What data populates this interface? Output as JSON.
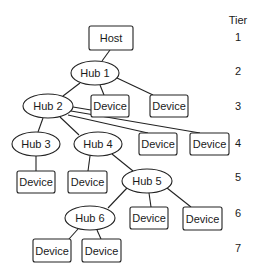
{
  "diagram": {
    "tier_header": "Tier",
    "tiers": [
      {
        "label": "1",
        "y": 41
      },
      {
        "label": "2",
        "y": 75
      },
      {
        "label": "3",
        "y": 110
      },
      {
        "label": "4",
        "y": 147
      },
      {
        "label": "5",
        "y": 181
      },
      {
        "label": "6",
        "y": 217
      },
      {
        "label": "7",
        "y": 252
      }
    ],
    "nodes": [
      {
        "id": "host",
        "type": "box",
        "label": "Host",
        "x": 89,
        "y": 26,
        "w": 44,
        "h": 24
      },
      {
        "id": "hub1",
        "type": "hub",
        "label": "Hub 1",
        "cx": 95,
        "cy": 73,
        "rx": 24,
        "ry": 12
      },
      {
        "id": "hub2",
        "type": "hub",
        "label": "Hub 2",
        "cx": 48,
        "cy": 106,
        "rx": 25,
        "ry": 12
      },
      {
        "id": "dev3a",
        "type": "box",
        "label": "Device",
        "x": 91,
        "y": 95,
        "w": 38,
        "h": 22
      },
      {
        "id": "dev3b",
        "type": "box",
        "label": "Device",
        "x": 150,
        "y": 95,
        "w": 38,
        "h": 22
      },
      {
        "id": "hub3",
        "type": "hub",
        "label": "Hub 3",
        "cx": 36,
        "cy": 144,
        "rx": 24,
        "ry": 12
      },
      {
        "id": "hub4",
        "type": "hub",
        "label": "Hub 4",
        "cx": 98,
        "cy": 144,
        "rx": 24,
        "ry": 12
      },
      {
        "id": "dev4a",
        "type": "box",
        "label": "Device",
        "x": 139,
        "y": 133,
        "w": 38,
        "h": 22
      },
      {
        "id": "dev4b",
        "type": "box",
        "label": "Device",
        "x": 190,
        "y": 133,
        "w": 39,
        "h": 22
      },
      {
        "id": "dev5a",
        "type": "box",
        "label": "Device",
        "x": 17,
        "y": 171,
        "w": 38,
        "h": 22
      },
      {
        "id": "dev5b",
        "type": "box",
        "label": "Device",
        "x": 68,
        "y": 171,
        "w": 39,
        "h": 22
      },
      {
        "id": "hub5",
        "type": "hub",
        "label": "Hub 5",
        "cx": 147,
        "cy": 181,
        "rx": 25,
        "ry": 12
      },
      {
        "id": "hub6",
        "type": "hub",
        "label": "Hub 6",
        "cx": 90,
        "cy": 218,
        "rx": 25,
        "ry": 12
      },
      {
        "id": "dev6a",
        "type": "box",
        "label": "Device",
        "x": 130,
        "y": 207,
        "w": 38,
        "h": 22
      },
      {
        "id": "dev6b",
        "type": "box",
        "label": "Device",
        "x": 183,
        "y": 207,
        "w": 39,
        "h": 23
      },
      {
        "id": "dev7a",
        "type": "box",
        "label": "Device",
        "x": 33,
        "y": 239,
        "w": 38,
        "h": 23
      },
      {
        "id": "dev7b",
        "type": "box",
        "label": "Device",
        "x": 82,
        "y": 239,
        "w": 39,
        "h": 23
      }
    ],
    "edges": [
      {
        "from": "host",
        "to": "hub1",
        "x1": 110,
        "y1": 50,
        "x2": 102,
        "y2": 61
      },
      {
        "from": "hub1",
        "to": "hub2",
        "x1": 80,
        "y1": 83,
        "x2": 63,
        "y2": 96
      },
      {
        "from": "hub1",
        "to": "dev3a",
        "x1": 100,
        "y1": 85,
        "x2": 104,
        "y2": 95
      },
      {
        "from": "hub1",
        "to": "dev3b",
        "x1": 117,
        "y1": 78,
        "x2": 153,
        "y2": 95
      },
      {
        "from": "hub2",
        "to": "dev3a",
        "x1": 73,
        "y1": 107,
        "x2": 91,
        "y2": 110
      },
      {
        "from": "hub2",
        "to": "dev4b",
        "x1": 71,
        "y1": 111,
        "x2": 200,
        "y2": 133
      },
      {
        "from": "hub2",
        "to": "dev4a",
        "x1": 68,
        "y1": 115,
        "x2": 148,
        "y2": 133
      },
      {
        "from": "hub2",
        "to": "hub3",
        "x1": 43,
        "y1": 118,
        "x2": 38,
        "y2": 132
      },
      {
        "from": "hub2",
        "to": "hub4",
        "x1": 60,
        "y1": 117,
        "x2": 79,
        "y2": 135
      },
      {
        "from": "hub3",
        "to": "dev5a",
        "x1": 36,
        "y1": 156,
        "x2": 36,
        "y2": 171
      },
      {
        "from": "hub4",
        "to": "dev5b",
        "x1": 90,
        "y1": 156,
        "x2": 88,
        "y2": 171
      },
      {
        "from": "hub4",
        "to": "hub5",
        "x1": 112,
        "y1": 154,
        "x2": 133,
        "y2": 171
      },
      {
        "from": "hub5",
        "to": "hub6",
        "x1": 127,
        "y1": 188,
        "x2": 108,
        "y2": 208
      },
      {
        "from": "hub5",
        "to": "dev6a",
        "x1": 149,
        "y1": 193,
        "x2": 151,
        "y2": 207
      },
      {
        "from": "hub5",
        "to": "dev6b",
        "x1": 167,
        "y1": 188,
        "x2": 191,
        "y2": 207
      },
      {
        "from": "hub6",
        "to": "dev7a",
        "x1": 78,
        "y1": 229,
        "x2": 69,
        "y2": 239
      },
      {
        "from": "hub6",
        "to": "dev7b",
        "x1": 97,
        "y1": 230,
        "x2": 101,
        "y2": 239
      }
    ]
  }
}
